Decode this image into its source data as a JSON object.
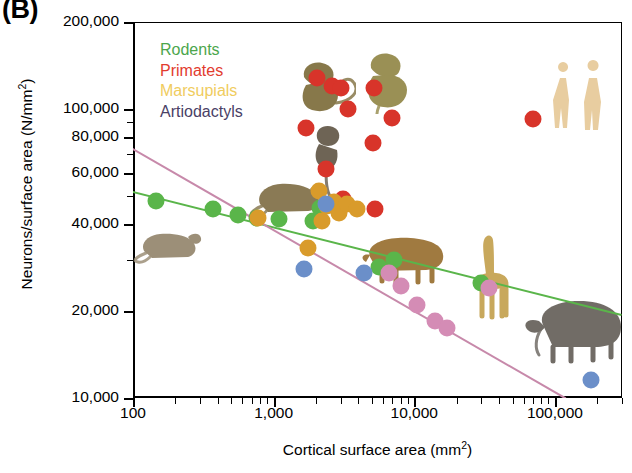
{
  "panel": {
    "label": "(B)"
  },
  "axes": {
    "y": {
      "title": "Neurons/surface area (N/mm",
      "title_sup": "2",
      "title_tail": ")",
      "scale": "log",
      "min": 10000,
      "max": 200000,
      "ticks": [
        {
          "value": 200000,
          "label": "200,000"
        },
        {
          "value": 100000,
          "label": "100,000"
        },
        {
          "value": 80000,
          "label": "80,000"
        },
        {
          "value": 60000,
          "label": "60,000"
        },
        {
          "value": 40000,
          "label": "40,000"
        },
        {
          "value": 20000,
          "label": "20,000"
        },
        {
          "value": 10000,
          "label": "10,000"
        }
      ],
      "minor_ticks": [
        90000,
        70000,
        50000,
        30000
      ]
    },
    "x": {
      "title": "Cortical surface area (mm",
      "title_sup": "2",
      "title_tail": ")",
      "scale": "log",
      "min": 100,
      "max": 300000,
      "ticks": [
        {
          "value": 100,
          "label": "100"
        },
        {
          "value": 1000,
          "label": "1,000"
        },
        {
          "value": 10000,
          "label": "10,000"
        },
        {
          "value": 100000,
          "label": "100,000"
        }
      ],
      "minor_ticks": [
        200,
        300,
        400,
        500,
        600,
        700,
        800,
        900,
        2000,
        3000,
        4000,
        5000,
        6000,
        7000,
        8000,
        9000,
        20000,
        30000,
        40000,
        50000,
        60000,
        70000,
        80000,
        90000,
        200000,
        300000
      ]
    }
  },
  "legend": {
    "position": "top-left-inside",
    "items": [
      {
        "label": "Rodents",
        "color": "#4ca64c"
      },
      {
        "label": "Primates",
        "color": "#e23b2e"
      },
      {
        "label": "Marsupials",
        "color": "#f0cc5e"
      },
      {
        "label": "Artiodactyls",
        "color": "#4a4166"
      }
    ]
  },
  "chart_data": {
    "type": "scatter",
    "title": "",
    "xlabel": "Cortical surface area (mm2)",
    "ylabel": "Neurons/surface area (N/mm2)",
    "xscale": "log",
    "yscale": "log",
    "xlim": [
      100,
      300000
    ],
    "ylim": [
      10000,
      200000
    ],
    "grid": false,
    "legend_position": "top-left-inside",
    "series": [
      {
        "name": "Rodents",
        "color": "#5ab54a",
        "points": [
          {
            "x": 145,
            "y": 48000
          },
          {
            "x": 370,
            "y": 45000
          },
          {
            "x": 560,
            "y": 43000
          },
          {
            "x": 760,
            "y": 42000
          },
          {
            "x": 1100,
            "y": 41500
          },
          {
            "x": 1900,
            "y": 41000
          },
          {
            "x": 2150,
            "y": 45500
          },
          {
            "x": 5600,
            "y": 28500
          },
          {
            "x": 7200,
            "y": 30000
          },
          {
            "x": 30000,
            "y": 25000
          }
        ]
      },
      {
        "name": "Primates",
        "color": "#d8342a",
        "points": [
          {
            "x": 1700,
            "y": 86000
          },
          {
            "x": 2050,
            "y": 128000
          },
          {
            "x": 2600,
            "y": 120000
          },
          {
            "x": 3000,
            "y": 118000
          },
          {
            "x": 3400,
            "y": 100000
          },
          {
            "x": 5200,
            "y": 118000
          },
          {
            "x": 7000,
            "y": 93000
          },
          {
            "x": 2350,
            "y": 62000
          },
          {
            "x": 3100,
            "y": 49000
          },
          {
            "x": 5300,
            "y": 45000
          },
          {
            "x": 5100,
            "y": 76000
          },
          {
            "x": 70000,
            "y": 92000
          }
        ]
      },
      {
        "name": "Marsupials",
        "color": "#d99b2b",
        "points": [
          {
            "x": 780,
            "y": 42000
          },
          {
            "x": 1750,
            "y": 33000
          },
          {
            "x": 2100,
            "y": 52000
          },
          {
            "x": 2400,
            "y": 46000
          },
          {
            "x": 2700,
            "y": 47500
          },
          {
            "x": 2900,
            "y": 43500
          },
          {
            "x": 3300,
            "y": 47000
          },
          {
            "x": 3900,
            "y": 45000
          },
          {
            "x": 2200,
            "y": 41000
          }
        ]
      },
      {
        "name": "Artiodactyls",
        "color": "#6b8fc9",
        "points": [
          {
            "x": 2350,
            "y": 47000
          },
          {
            "x": 1650,
            "y": 28000
          },
          {
            "x": 4400,
            "y": 27000
          },
          {
            "x": 180000,
            "y": 11500
          }
        ]
      },
      {
        "name": "Artiodactyls-trend-points",
        "color": "#d48cb5",
        "points": [
          {
            "x": 6600,
            "y": 27000
          },
          {
            "x": 8000,
            "y": 24500
          },
          {
            "x": 10500,
            "y": 21000
          },
          {
            "x": 14000,
            "y": 18500
          },
          {
            "x": 17000,
            "y": 17500
          },
          {
            "x": 34000,
            "y": 24000
          }
        ]
      }
    ],
    "trendlines": [
      {
        "name": "Rodent regression",
        "color": "#5ab54a",
        "x1": 100,
        "y1": 52000,
        "x2": 300000,
        "y2": 19500
      },
      {
        "name": "Artiodactyl regression",
        "color": "#c789aa",
        "x1": 100,
        "y1": 73000,
        "x2": 120000,
        "y2": 10000
      }
    ],
    "annotations": [
      {
        "name": "mouse-illustration",
        "x": 180,
        "y": 35000
      },
      {
        "name": "rat-illustration",
        "x": 1250,
        "y": 51000
      },
      {
        "name": "capuchin-illustration",
        "x": 2100,
        "y": 120000
      },
      {
        "name": "macaque-illustration",
        "x": 6000,
        "y": 125000
      },
      {
        "name": "marmoset-illustration",
        "x": 2400,
        "y": 66000
      },
      {
        "name": "capybara-illustration",
        "x": 8500,
        "y": 31000
      },
      {
        "name": "giraffe-illustration",
        "x": 33000,
        "y": 26500
      },
      {
        "name": "elephant-illustration",
        "x": 140000,
        "y": 17500
      },
      {
        "name": "human-illustration",
        "x": 150000,
        "y": 110000
      }
    ]
  }
}
